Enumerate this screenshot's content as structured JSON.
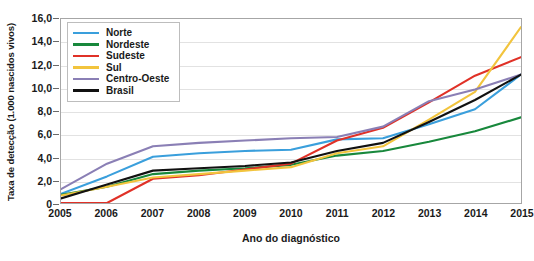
{
  "chart_data": {
    "type": "line",
    "title": "",
    "xlabel": "Ano do diagnóstico",
    "ylabel": "Taxa de detecção (1.000 nascidos vivos)",
    "x": [
      2005,
      2006,
      2007,
      2008,
      2009,
      2010,
      2011,
      2012,
      2013,
      2014,
      2015
    ],
    "xticklabels": [
      "2005",
      "2006",
      "2007",
      "2008",
      "2009",
      "2010",
      "2011",
      "2012",
      "2013",
      "2014",
      "2015"
    ],
    "yticklabels": [
      "0",
      "2,0",
      "4,0",
      "6,0",
      "8,0",
      "10,0",
      "12,0",
      "14,0",
      "16,0"
    ],
    "yticks": [
      0,
      2,
      4,
      6,
      8,
      10,
      12,
      14,
      16
    ],
    "ylim": [
      0,
      16
    ],
    "xlim": [
      2005,
      2015
    ],
    "grid": true,
    "legend_position": "upper-left",
    "series": [
      {
        "name": "Norte",
        "color": "#3a9fdc",
        "values": [
          0.9,
          2.4,
          4.1,
          4.4,
          4.6,
          4.7,
          5.6,
          5.7,
          6.9,
          8.2,
          11.2
        ]
      },
      {
        "name": "Nordeste",
        "color": "#18883c",
        "values": [
          0.8,
          1.5,
          2.6,
          2.9,
          3.1,
          3.4,
          4.2,
          4.6,
          5.4,
          6.3,
          7.5
        ]
      },
      {
        "name": "Sudeste",
        "color": "#e03127",
        "values": [
          0.1,
          0.1,
          2.2,
          2.5,
          3.0,
          3.5,
          5.5,
          6.6,
          8.8,
          11.1,
          12.7
        ]
      },
      {
        "name": "Sul",
        "color": "#f2c43d",
        "values": [
          0.75,
          1.5,
          2.3,
          2.6,
          2.9,
          3.2,
          4.4,
          5.0,
          7.3,
          9.7,
          15.3
        ]
      },
      {
        "name": "Centro-Oeste",
        "color": "#8a7fb5",
        "values": [
          1.3,
          3.5,
          5.0,
          5.3,
          5.5,
          5.7,
          5.8,
          6.7,
          8.9,
          9.9,
          11.2
        ]
      },
      {
        "name": "Brasil",
        "color": "#111111",
        "values": [
          0.5,
          1.7,
          2.9,
          3.1,
          3.3,
          3.6,
          4.6,
          5.3,
          7.1,
          9.0,
          11.2
        ]
      }
    ]
  },
  "legend": {
    "entries": [
      {
        "label": "Norte",
        "color": "#3a9fdc",
        "icon": "line-swatch-icon"
      },
      {
        "label": "Nordeste",
        "color": "#18883c",
        "icon": "line-swatch-icon"
      },
      {
        "label": "Sudeste",
        "color": "#e03127",
        "icon": "line-swatch-icon"
      },
      {
        "label": "Sul",
        "color": "#f2c43d",
        "icon": "line-swatch-icon"
      },
      {
        "label": "Centro-Oeste",
        "color": "#8a7fb5",
        "icon": "line-swatch-icon"
      },
      {
        "label": "Brasil",
        "color": "#111111",
        "icon": "line-swatch-icon"
      }
    ]
  }
}
